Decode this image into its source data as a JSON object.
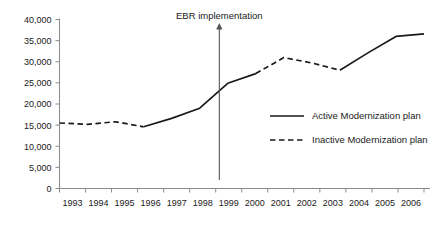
{
  "chart_data": {
    "type": "line",
    "title": "",
    "xlabel": "",
    "ylabel": "",
    "grid": false,
    "legend_position": "inside-right",
    "categories": [
      "1993",
      "1994",
      "1995",
      "1996",
      "1997",
      "1998",
      "1999",
      "2000",
      "2001",
      "2002",
      "2003",
      "2004",
      "2005",
      "2006"
    ],
    "x": [
      1993,
      1994,
      1995,
      1996,
      1997,
      1998,
      1999,
      2000,
      2001,
      2002,
      2003,
      2004,
      2005,
      2006
    ],
    "values": [
      15500,
      15200,
      15800,
      14600,
      16600,
      19000,
      24900,
      27200,
      31000,
      29700,
      28000,
      32100,
      36000,
      36600
    ],
    "segments": [
      {
        "style": "dashed",
        "legend": "Inactive Modernization plan",
        "x": [
          1993,
          1994,
          1995,
          1996
        ],
        "values": [
          15500,
          15200,
          15800,
          14600
        ]
      },
      {
        "style": "solid",
        "legend": "Active Modernization plan",
        "x": [
          1996,
          1997,
          1998,
          1999,
          2000
        ],
        "values": [
          14600,
          16600,
          19000,
          24900,
          27200
        ]
      },
      {
        "style": "dashed",
        "legend": "Inactive Modernization plan",
        "x": [
          2000,
          2001,
          2002,
          2003
        ],
        "values": [
          27200,
          31000,
          29700,
          28000
        ]
      },
      {
        "style": "solid",
        "legend": "Active Modernization plan",
        "x": [
          2003,
          2004,
          2005,
          2006
        ],
        "values": [
          28000,
          32100,
          36000,
          36600
        ]
      }
    ],
    "ylim": [
      0,
      40000
    ],
    "ytick_values": [
      0,
      5000,
      10000,
      15000,
      20000,
      25000,
      30000,
      35000,
      40000
    ],
    "ytick_labels": [
      "0",
      "5,000",
      "10,000",
      "15,000",
      "20,000",
      "25,000",
      "30,000",
      "35,000",
      "40,000"
    ],
    "xtick_labels": [
      "1993",
      "1994",
      "1995",
      "1996",
      "1997",
      "1998",
      "1999",
      "2000",
      "2001",
      "2002",
      "2003",
      "2004",
      "2005",
      "2006"
    ],
    "annotations": [
      {
        "text": "EBR implementation",
        "x": 1998.7,
        "kind": "vertical-arrow",
        "y_from": 2000,
        "y_to": 39200
      }
    ],
    "legend": [
      {
        "label": "Active Modernization plan",
        "style": "solid"
      },
      {
        "label": "Inactive Modernization plan",
        "style": "dashed"
      }
    ],
    "colors": {
      "series": "#1a1a1a",
      "axis": "#8a8a8a",
      "annotation": "#555555",
      "background": "#ffffff"
    }
  }
}
